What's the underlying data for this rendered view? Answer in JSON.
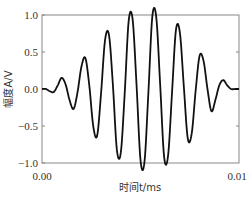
{
  "chart_data": {
    "type": "line",
    "title": "",
    "xlabel": "时间t/ms",
    "ylabel": "幅度A/V",
    "xlim": [
      0.0,
      0.01
    ],
    "ylim": [
      -1.0,
      1.0
    ],
    "x_ticks": [
      "0.00",
      "0.01"
    ],
    "y_ticks": [
      "1.0",
      "0.5",
      "0.0",
      "−0.5",
      "−1.0"
    ],
    "grid": false,
    "legend": null,
    "series": [
      {
        "name": "Gaussian-modulated tone burst",
        "color": "#111111",
        "x": [
          0.0,
          0.0002,
          0.0004,
          0.0006,
          0.0008,
          0.001,
          0.0012,
          0.0014,
          0.0016,
          0.0018,
          0.002,
          0.0022,
          0.0024,
          0.0026,
          0.0028,
          0.003,
          0.0032,
          0.0034,
          0.0036,
          0.0038,
          0.004,
          0.0042,
          0.0044,
          0.0046,
          0.0048,
          0.005,
          0.0052,
          0.0054,
          0.0056,
          0.0058,
          0.006,
          0.0062,
          0.0064,
          0.0066,
          0.0068,
          0.007,
          0.0072,
          0.0074,
          0.0076,
          0.0078,
          0.008,
          0.0082,
          0.0084,
          0.0086,
          0.0088,
          0.009,
          0.0092,
          0.0094,
          0.0096,
          0.0098,
          0.01
        ],
        "y": [
          0.0,
          0.0,
          -0.03,
          -0.04,
          0.05,
          0.15,
          0.06,
          -0.15,
          -0.27,
          -0.05,
          0.3,
          0.42,
          0.05,
          -0.5,
          -0.63,
          -0.05,
          0.66,
          0.73,
          0.05,
          -0.82,
          -0.86,
          -0.05,
          0.92,
          0.94,
          0.05,
          -0.96,
          -0.99,
          -0.05,
          0.98,
          0.97,
          0.05,
          -0.92,
          -0.9,
          -0.05,
          0.8,
          0.76,
          0.03,
          -0.67,
          -0.6,
          -0.02,
          0.45,
          0.38,
          0.0,
          -0.3,
          -0.15,
          0.05,
          0.12,
          0.05,
          0.0,
          0.0,
          0.0
        ]
      }
    ]
  }
}
